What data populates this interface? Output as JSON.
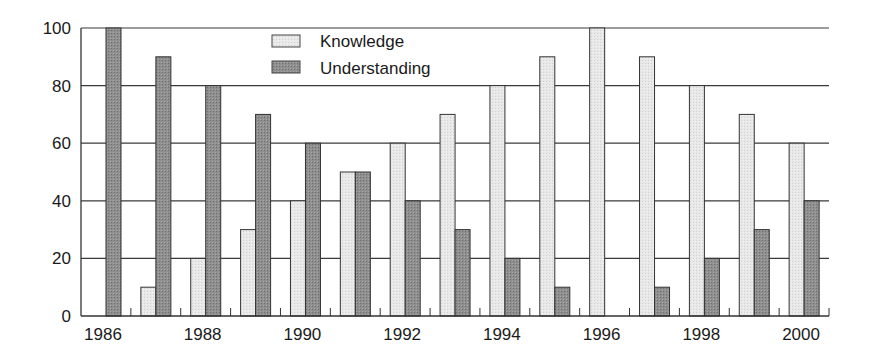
{
  "chart_data": {
    "type": "bar",
    "title": "",
    "xlabel": "",
    "ylabel": "",
    "ylim": [
      0,
      100
    ],
    "yticks": [
      0,
      20,
      40,
      60,
      80,
      100
    ],
    "grid": true,
    "legend_position": "top-center",
    "categories": [
      "1986",
      "1987",
      "1988",
      "1989",
      "1990",
      "1991",
      "1992",
      "1993",
      "1994",
      "1995",
      "1996",
      "1997",
      "1998",
      "1999",
      "2000"
    ],
    "x_tick_labels": [
      "1986",
      "1988",
      "1990",
      "1992",
      "1994",
      "1996",
      "1998",
      "2000"
    ],
    "series": [
      {
        "name": "Knowledge",
        "color": "#e6e6e6",
        "values": [
          0,
          10,
          20,
          30,
          40,
          50,
          60,
          70,
          80,
          90,
          100,
          90,
          80,
          70,
          60
        ]
      },
      {
        "name": "Understanding",
        "color": "#8c8c8c",
        "values": [
          100,
          90,
          80,
          70,
          60,
          50,
          40,
          30,
          20,
          10,
          0,
          10,
          20,
          30,
          40
        ]
      }
    ]
  },
  "legend": {
    "items": [
      {
        "label": "Knowledge"
      },
      {
        "label": "Understanding"
      }
    ]
  }
}
